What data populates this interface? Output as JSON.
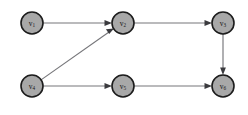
{
  "figure": {
    "background_color": "#ffffff",
    "width": 248,
    "height": 115
  },
  "style": {
    "node_fill": "#a8a8a8",
    "node_stroke": "#1c1c1c",
    "edge_color": "#76767a",
    "arrowhead_color": "#3a3a3e",
    "label_color": "#18181a",
    "node_radius": 11
  },
  "graph": {
    "type": "directed",
    "node_count": 6,
    "edge_count": 6,
    "nodes": [
      {
        "id": "v1",
        "base": "v",
        "sub": "1",
        "label": "v1",
        "cx": 32,
        "cy": 23
      },
      {
        "id": "v2",
        "base": "v",
        "sub": "2",
        "label": "v2",
        "cx": 123,
        "cy": 23
      },
      {
        "id": "v3",
        "base": "v",
        "sub": "3",
        "label": "v3",
        "cx": 223,
        "cy": 23
      },
      {
        "id": "v4",
        "base": "v",
        "sub": "4",
        "label": "v4",
        "cx": 32,
        "cy": 86
      },
      {
        "id": "v5",
        "base": "v",
        "sub": "5",
        "label": "v5",
        "cx": 123,
        "cy": 86
      },
      {
        "id": "v6",
        "base": "v",
        "sub": "6",
        "label": "v6",
        "cx": 223,
        "cy": 86
      }
    ],
    "edges": [
      {
        "id": "e1",
        "from": "v1",
        "to": "v2",
        "orientation": "horizontal",
        "directed": true
      },
      {
        "id": "e2",
        "from": "v4",
        "to": "v2",
        "orientation": "diagonal",
        "directed": true
      },
      {
        "id": "e3",
        "from": "v2",
        "to": "v3",
        "orientation": "horizontal",
        "directed": true
      },
      {
        "id": "e4",
        "from": "v3",
        "to": "v6",
        "orientation": "vertical",
        "directed": true
      },
      {
        "id": "e5",
        "from": "v4",
        "to": "v5",
        "orientation": "horizontal",
        "directed": true
      },
      {
        "id": "e6",
        "from": "v5",
        "to": "v6",
        "orientation": "horizontal",
        "directed": true
      }
    ]
  }
}
